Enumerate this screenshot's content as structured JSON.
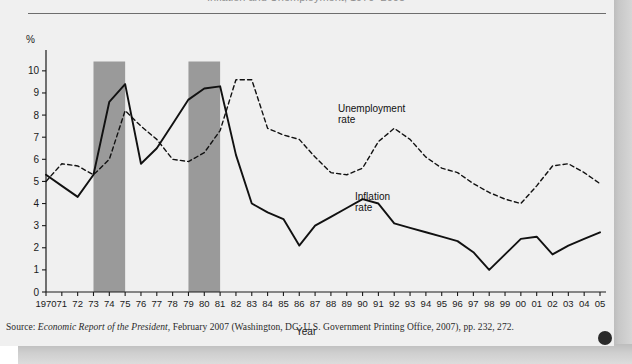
{
  "figure": {
    "title_clipped": "Inflation and Unemployment, 1970–2005",
    "ylabel": "%",
    "xlabel": "Year",
    "corner_dot": "page-marker-dot"
  },
  "source": {
    "prefix": "Source: ",
    "italic_title": "Economic Report of the President",
    "rest": ", February 2007 (Washington, DC: U.S. Government Printing Office, 2007), pp. 232, 272."
  },
  "series_labels": {
    "unemployment_line1": "Unemployment",
    "unemployment_line2": "rate",
    "inflation_line1": "Inflation",
    "inflation_line2": "rate"
  },
  "colors": {
    "paper": "#f0f0f0",
    "line": "#111111",
    "recession_band": "#9a9a9a",
    "axis": "#1a1a1a",
    "rule": "#6d6d6d",
    "dot": "#2a2a2a"
  },
  "chart_data": {
    "type": "line",
    "title": "Inflation and Unemployment, 1970–2005",
    "xlabel": "Year",
    "ylabel": "%",
    "ylim": [
      0,
      10.4
    ],
    "yticks": [
      0,
      1,
      2,
      3,
      4,
      5,
      6,
      7,
      8,
      9,
      10
    ],
    "ytick_labels": [
      "0",
      "1",
      "2",
      "3",
      "4",
      "5",
      "6",
      "7",
      "8",
      "9",
      "10"
    ],
    "grid": false,
    "legend": "inline-annotations",
    "x": [
      1970,
      1971,
      1972,
      1973,
      1974,
      1975,
      1976,
      1977,
      1978,
      1979,
      1980,
      1981,
      1982,
      1983,
      1984,
      1985,
      1986,
      1987,
      1988,
      1989,
      1990,
      1991,
      1992,
      1993,
      1994,
      1995,
      1996,
      1997,
      1998,
      1999,
      2000,
      2001,
      2002,
      2003,
      2004,
      2005
    ],
    "xtick_labels": [
      "1970",
      "71",
      "72",
      "73",
      "74",
      "75",
      "76",
      "77",
      "78",
      "79",
      "80",
      "81",
      "82",
      "83",
      "84",
      "85",
      "86",
      "87",
      "88",
      "89",
      "90",
      "91",
      "92",
      "93",
      "94",
      "95",
      "96",
      "97",
      "98",
      "99",
      "00",
      "01",
      "02",
      "03",
      "04",
      "05"
    ],
    "series": [
      {
        "name": "Inflation rate",
        "style": "solid",
        "values": [
          5.3,
          4.8,
          4.3,
          5.3,
          8.6,
          9.4,
          5.8,
          6.5,
          7.6,
          8.7,
          9.2,
          9.3,
          6.2,
          4.0,
          3.6,
          3.3,
          2.1,
          3.0,
          3.4,
          3.8,
          4.2,
          4.0,
          3.1,
          2.9,
          2.7,
          2.5,
          2.3,
          1.8,
          1.0,
          1.7,
          2.4,
          2.5,
          1.7,
          2.1,
          2.4,
          2.7
        ]
      },
      {
        "name": "Unemployment rate",
        "style": "dashed",
        "values": [
          5.0,
          5.8,
          5.7,
          5.3,
          6.0,
          8.2,
          7.5,
          6.9,
          6.0,
          5.9,
          6.3,
          7.3,
          9.6,
          9.6,
          7.4,
          7.1,
          6.9,
          6.1,
          5.4,
          5.3,
          5.6,
          6.8,
          7.4,
          6.9,
          6.1,
          5.6,
          5.4,
          4.9,
          4.5,
          4.2,
          4.0,
          4.8,
          5.7,
          5.8,
          5.4,
          4.9
        ]
      }
    ],
    "recession_bands": [
      {
        "start": 1973,
        "end": 1975,
        "label": "recession-1973-75"
      },
      {
        "start": 1979,
        "end": 1981,
        "label": "recession-1979-81"
      }
    ]
  }
}
